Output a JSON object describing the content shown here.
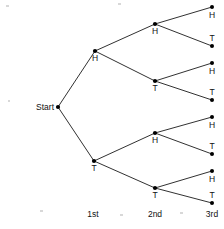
{
  "figure": {
    "type": "probability-tree-diagram",
    "start_label": "Start",
    "start_node": {
      "x": 58,
      "y": 107
    },
    "stage_labels": [
      {
        "text": "1st",
        "x": 93,
        "y": 217
      },
      {
        "text": "2nd",
        "x": 155,
        "y": 217
      },
      {
        "text": "3rd",
        "x": 212,
        "y": 217
      }
    ],
    "level1": [
      {
        "id": "H",
        "label": "H",
        "x": 95,
        "y": 51,
        "label_x": 95,
        "label_y": 61
      },
      {
        "id": "T",
        "label": "T",
        "x": 94,
        "y": 161,
        "label_x": 94,
        "label_y": 171
      }
    ],
    "level2": [
      {
        "id": "HH",
        "label": "H",
        "x": 155,
        "y": 24,
        "label_x": 155,
        "label_y": 34
      },
      {
        "id": "HT",
        "label": "T",
        "x": 155,
        "y": 81,
        "label_x": 155,
        "label_y": 91
      },
      {
        "id": "TH",
        "label": "H",
        "x": 155,
        "y": 133,
        "label_x": 155,
        "label_y": 143
      },
      {
        "id": "TT",
        "label": "T",
        "x": 155,
        "y": 188,
        "label_x": 155,
        "label_y": 198
      }
    ],
    "level3": [
      {
        "id": "HHH",
        "label": "H",
        "x": 212,
        "y": 7,
        "label_x": 212,
        "label_y": 18
      },
      {
        "id": "HHT",
        "label": "T",
        "x": 212,
        "y": 46,
        "label_x": 212,
        "label_y": 41
      },
      {
        "id": "HTH",
        "label": "H",
        "x": 212,
        "y": 63,
        "label_x": 212,
        "label_y": 74
      },
      {
        "id": "HTT",
        "label": "T",
        "x": 212,
        "y": 100,
        "label_x": 212,
        "label_y": 95
      },
      {
        "id": "THH",
        "label": "H",
        "x": 212,
        "y": 117,
        "label_x": 212,
        "label_y": 128
      },
      {
        "id": "THT",
        "label": "T",
        "x": 212,
        "y": 154,
        "label_x": 212,
        "label_y": 149
      },
      {
        "id": "TTH",
        "label": "H",
        "x": 212,
        "y": 171,
        "label_x": 212,
        "label_y": 182
      },
      {
        "id": "TTT",
        "label": "T",
        "x": 212,
        "y": 203,
        "label_x": 212,
        "label_y": 198
      }
    ],
    "edges": [
      {
        "from": "Start",
        "to": "H",
        "x1": 58,
        "y1": 107,
        "x2": 95,
        "y2": 51
      },
      {
        "from": "Start",
        "to": "T",
        "x1": 58,
        "y1": 107,
        "x2": 94,
        "y2": 161
      },
      {
        "from": "H",
        "to": "HH",
        "x1": 95,
        "y1": 51,
        "x2": 155,
        "y2": 24
      },
      {
        "from": "H",
        "to": "HT",
        "x1": 95,
        "y1": 51,
        "x2": 155,
        "y2": 81
      },
      {
        "from": "T",
        "to": "TH",
        "x1": 94,
        "y1": 161,
        "x2": 155,
        "y2": 133
      },
      {
        "from": "T",
        "to": "TT",
        "x1": 94,
        "y1": 161,
        "x2": 155,
        "y2": 188
      },
      {
        "from": "HH",
        "to": "HHH",
        "x1": 155,
        "y1": 24,
        "x2": 212,
        "y2": 7
      },
      {
        "from": "HH",
        "to": "HHT",
        "x1": 155,
        "y1": 24,
        "x2": 212,
        "y2": 46
      },
      {
        "from": "HT",
        "to": "HTH",
        "x1": 155,
        "y1": 81,
        "x2": 212,
        "y2": 63
      },
      {
        "from": "HT",
        "to": "HTT",
        "x1": 155,
        "y1": 81,
        "x2": 212,
        "y2": 100
      },
      {
        "from": "TH",
        "to": "THH",
        "x1": 155,
        "y1": 133,
        "x2": 212,
        "y2": 117
      },
      {
        "from": "TH",
        "to": "THT",
        "x1": 155,
        "y1": 133,
        "x2": 212,
        "y2": 154
      },
      {
        "from": "TT",
        "to": "TTH",
        "x1": 155,
        "y1": 188,
        "x2": 212,
        "y2": 171
      },
      {
        "from": "TT",
        "to": "TTT",
        "x1": 155,
        "y1": 188,
        "x2": 212,
        "y2": 203
      }
    ],
    "colors": {
      "line": "#1a1a1a",
      "node": "#000000",
      "text": "#111111",
      "background": "#ffffff"
    }
  }
}
